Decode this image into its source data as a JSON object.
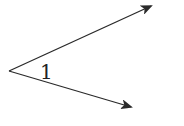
{
  "diagram": {
    "type": "angle",
    "angle_label": "1",
    "colors": {
      "stroke": "#2a2a2a",
      "background": "#ffffff"
    },
    "vertex": {
      "x": 9,
      "y": 71
    },
    "rays": [
      {
        "name": "upper-ray",
        "end": {
          "x": 151,
          "y": 6
        }
      },
      {
        "name": "lower-ray",
        "end": {
          "x": 131,
          "y": 107
        }
      }
    ]
  }
}
